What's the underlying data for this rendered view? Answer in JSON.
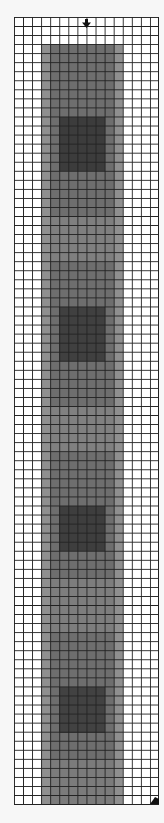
{
  "grid": {
    "columns": 16,
    "rows": 87,
    "cell_px": 9.06,
    "line_color": "#222222",
    "background": "#ffffff"
  },
  "shaded_region": {
    "col_start": 3,
    "col_end": 12,
    "row_start": 3,
    "row_end": 87,
    "outer_color": "#8f8f8f",
    "inner_base_color": "#6e6e6e",
    "dark_bands": [
      {
        "row_start": 11,
        "row_end": 17,
        "color": "#3c3c3c"
      },
      {
        "row_start": 32,
        "row_end": 38,
        "color": "#404040"
      },
      {
        "row_start": 54,
        "row_end": 59,
        "color": "#3e3e3e"
      },
      {
        "row_start": 74,
        "row_end": 79,
        "color": "#424242"
      }
    ],
    "light_bands": [
      {
        "row_start": 22,
        "row_end": 27,
        "color": "#7f7f7f"
      },
      {
        "row_start": 43,
        "row_end": 48,
        "color": "#808080"
      },
      {
        "row_start": 62,
        "row_end": 68,
        "color": "#7d7d7d"
      },
      {
        "row_start": 82,
        "row_end": 87,
        "color": "#7b7b7b"
      }
    ]
  },
  "markers": {
    "top_arrow": {
      "icon": "down-arrow-icon",
      "column": 8,
      "row": 0
    },
    "bottom_corner": {
      "icon": "corner-triangle-icon",
      "column": 15,
      "row": 86
    }
  }
}
